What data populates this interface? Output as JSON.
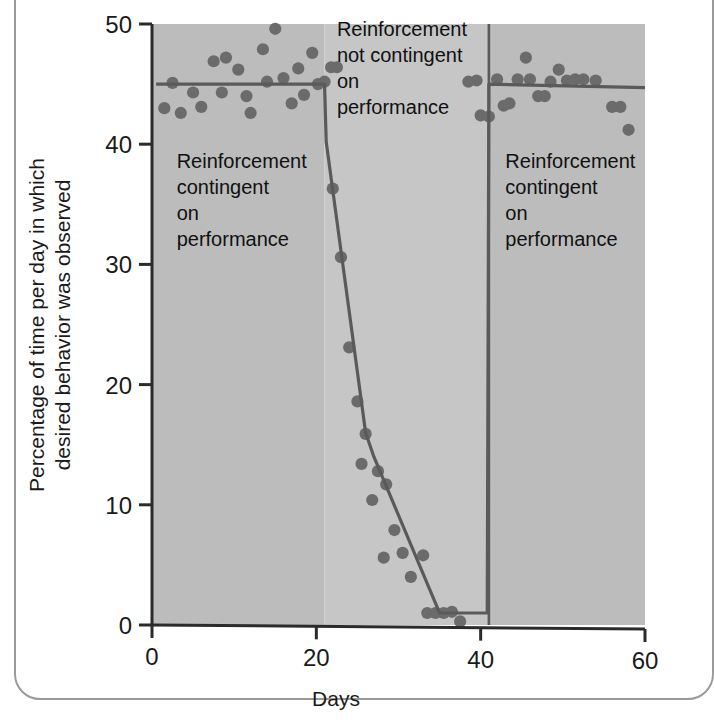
{
  "chart_data": {
    "type": "scatter",
    "title": "",
    "subtitle": "",
    "xlabel": "Days",
    "ylabel": "Percentage of time per day in which desired behavior was observed",
    "ylabel_line1": "Percentage of time per day in which",
    "ylabel_line2": "desired behavior was observed",
    "xlim": [
      0,
      60
    ],
    "ylim": [
      0,
      50
    ],
    "xticks": [
      0,
      20,
      40,
      60
    ],
    "xtick_labels": [
      "0",
      "20",
      "40",
      "60"
    ],
    "yticks": [
      0,
      10,
      20,
      30,
      40,
      50
    ],
    "ytick_labels": [
      "0",
      "10",
      "20",
      "30",
      "40",
      "50"
    ],
    "grid": false,
    "legend": "none",
    "plot_background": "#bdbdbd",
    "marker_color": "#6b6b6b",
    "trend_color": "#5a5a5a",
    "axis_color": "#2b2b2b",
    "phase_band_colors": [
      "#bcbcbc",
      "#c6c6c6",
      "#bcbcbc"
    ],
    "phase_boundaries_x": [
      21,
      41
    ],
    "series": [
      {
        "name": "Percentage of time desired behavior observed",
        "marker": "filled-circle",
        "points": [
          [
            1.5,
            43.0
          ],
          [
            2.5,
            45.1
          ],
          [
            3.5,
            42.6
          ],
          [
            5.0,
            44.3
          ],
          [
            6.0,
            43.1
          ],
          [
            7.5,
            46.9
          ],
          [
            8.5,
            44.3
          ],
          [
            9.0,
            47.2
          ],
          [
            10.5,
            46.2
          ],
          [
            11.5,
            44.0
          ],
          [
            12.0,
            42.6
          ],
          [
            13.5,
            47.9
          ],
          [
            14.0,
            45.2
          ],
          [
            15.0,
            49.6
          ],
          [
            16.0,
            45.5
          ],
          [
            17.0,
            43.4
          ],
          [
            17.8,
            46.3
          ],
          [
            18.5,
            44.1
          ],
          [
            19.5,
            47.6
          ],
          [
            20.2,
            45.0
          ],
          [
            21.0,
            45.2
          ],
          [
            21.8,
            46.4
          ],
          [
            22.5,
            46.4
          ],
          [
            22.0,
            36.3
          ],
          [
            23.0,
            30.6
          ],
          [
            24.0,
            23.1
          ],
          [
            25.0,
            18.6
          ],
          [
            26.0,
            15.9
          ],
          [
            25.5,
            13.4
          ],
          [
            27.5,
            12.8
          ],
          [
            28.5,
            11.7
          ],
          [
            26.8,
            10.4
          ],
          [
            29.5,
            7.9
          ],
          [
            30.5,
            6.0
          ],
          [
            28.2,
            5.6
          ],
          [
            31.5,
            4.0
          ],
          [
            33.0,
            5.8
          ],
          [
            33.5,
            1.0
          ],
          [
            34.5,
            1.0
          ],
          [
            35.5,
            1.0
          ],
          [
            36.5,
            1.1
          ],
          [
            37.5,
            0.3
          ],
          [
            38.5,
            45.2
          ],
          [
            39.5,
            45.3
          ],
          [
            40.0,
            42.4
          ],
          [
            41.0,
            42.3
          ],
          [
            42.0,
            45.4
          ],
          [
            42.8,
            43.2
          ],
          [
            43.5,
            43.4
          ],
          [
            44.5,
            45.4
          ],
          [
            46.0,
            45.4
          ],
          [
            45.5,
            47.2
          ],
          [
            47.0,
            44.0
          ],
          [
            47.8,
            44.0
          ],
          [
            48.5,
            45.2
          ],
          [
            49.5,
            46.2
          ],
          [
            50.5,
            45.3
          ],
          [
            51.5,
            45.4
          ],
          [
            52.5,
            45.4
          ],
          [
            54.0,
            45.3
          ],
          [
            56.0,
            43.1
          ],
          [
            57.0,
            43.1
          ],
          [
            58.0,
            41.2
          ]
        ]
      }
    ],
    "trend_line": [
      [
        0.5,
        45.0
      ],
      [
        21.0,
        45.0
      ],
      [
        21.2,
        40.2
      ],
      [
        26.0,
        16.0
      ],
      [
        27.0,
        14.0
      ],
      [
        35.0,
        1.0
      ],
      [
        40.8,
        1.0
      ],
      [
        41.0,
        45.0
      ],
      [
        60.0,
        44.7
      ]
    ],
    "annotations": [
      {
        "id": "phase-1",
        "lines": [
          "Reinforcement",
          "contingent",
          "on",
          "performance"
        ],
        "x_data": 3.0,
        "y_data": 38.0
      },
      {
        "id": "phase-2",
        "lines": [
          "Reinforcement",
          "not contingent",
          "on",
          "performance"
        ],
        "x_data": 22.5,
        "y_data": 49.0
      },
      {
        "id": "phase-3",
        "lines": [
          "Reinforcement",
          "contingent",
          "on",
          "performance"
        ],
        "x_data": 43.0,
        "y_data": 38.0
      }
    ]
  }
}
